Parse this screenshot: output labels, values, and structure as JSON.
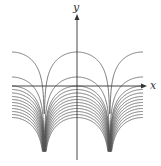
{
  "chart_data": {
    "type": "line",
    "title": "",
    "xlabel": "x",
    "ylabel": "y",
    "grid": false,
    "legend": null,
    "axis_color": "#333333",
    "curve_color": "#555555",
    "pixel_frame": {
      "origin_px": [
        77,
        86
      ],
      "x_axis_start_px": 12,
      "x_axis_end_px": 146,
      "y_axis_top_px": 14,
      "y_axis_bottom_px": 160,
      "period_px": 65.5,
      "asymptotes_px": [
        44.3,
        109.8
      ],
      "curve_x_range_px": [
        12,
        143
      ],
      "bottom_clip_px": 151
    },
    "curve_peaks_px": [
      52,
      77,
      86,
      89.5,
      93,
      96.5,
      99.5,
      102.5,
      105.5,
      108.5,
      111.5,
      114.5,
      117.5
    ],
    "y_scale_px_per_unit": 14
  },
  "axes": {
    "x_label": "x",
    "y_label": "y"
  }
}
